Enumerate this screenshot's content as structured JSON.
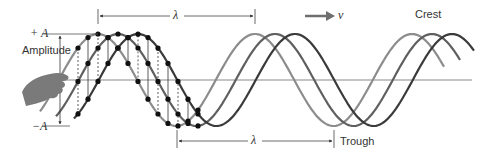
{
  "labels": {
    "plus_a": "+ A",
    "minus_a": "−A",
    "amplitude": "Amplitude",
    "lambda_top": "λ",
    "lambda_bottom": "λ",
    "velocity": "v",
    "crest": "Crest",
    "trough": "Trough"
  },
  "geometry": {
    "baseline_y": 80,
    "amplitude_px": 46,
    "wavelength_px": 157,
    "baseline_x": [
      62,
      472
    ]
  },
  "waves": [
    {
      "name": "wave-light",
      "color": "#8c8c8c",
      "peak_x": 98,
      "x_start": 40,
      "x_end": 444
    },
    {
      "name": "wave-medium",
      "color": "#5f5f5f",
      "peak_x": 118,
      "x_start": 56,
      "x_end": 460
    },
    {
      "name": "wave-dark",
      "color": "#3a3a3a",
      "peak_x": 138,
      "x_start": 74,
      "x_end": 474
    }
  ],
  "colors": {
    "baseline": "#8a8a8a",
    "dots": "#111111",
    "arrows": "#333333",
    "hand": "#7a7a7a",
    "velocity_arrow": "#6e6e6e"
  }
}
